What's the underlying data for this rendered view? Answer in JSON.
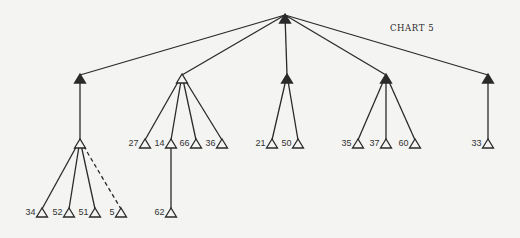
{
  "chart": {
    "title": "CHART 5",
    "stroke_color": "#2a2a2a",
    "background": "#f4f4f2"
  },
  "tree": {
    "root": {
      "id": "root",
      "x": 285,
      "y": 23,
      "filled": true
    },
    "nodes": [
      {
        "id": "a",
        "x": 80,
        "y": 83,
        "filled": true,
        "parent": "root"
      },
      {
        "id": "b",
        "x": 182,
        "y": 83,
        "filled": false,
        "parent": "root"
      },
      {
        "id": "c",
        "x": 287,
        "y": 83,
        "filled": true,
        "parent": "root"
      },
      {
        "id": "d",
        "x": 386,
        "y": 83,
        "filled": true,
        "parent": "root"
      },
      {
        "id": "e",
        "x": 488,
        "y": 83,
        "filled": true,
        "parent": "root"
      },
      {
        "id": "a1",
        "x": 80,
        "y": 148,
        "filled": false,
        "parent": "a"
      },
      {
        "id": "n34",
        "x": 42,
        "y": 217,
        "label": "34",
        "parent": "a1"
      },
      {
        "id": "n52",
        "x": 69,
        "y": 217,
        "label": "52",
        "parent": "a1"
      },
      {
        "id": "n51",
        "x": 95,
        "y": 217,
        "label": "51",
        "parent": "a1"
      },
      {
        "id": "n5",
        "x": 121,
        "y": 217,
        "label": "5",
        "parent": "a1",
        "dashed": true
      },
      {
        "id": "n27",
        "x": 145,
        "y": 148,
        "label": "27",
        "parent": "b"
      },
      {
        "id": "n14",
        "x": 171,
        "y": 148,
        "label": "14",
        "parent": "b"
      },
      {
        "id": "n66",
        "x": 196,
        "y": 148,
        "label": "66",
        "parent": "b"
      },
      {
        "id": "n36",
        "x": 222,
        "y": 148,
        "label": "36",
        "parent": "b"
      },
      {
        "id": "n62",
        "x": 171,
        "y": 217,
        "label": "62",
        "parent": "n14"
      },
      {
        "id": "n21",
        "x": 272,
        "y": 148,
        "label": "21",
        "parent": "c"
      },
      {
        "id": "n50",
        "x": 298,
        "y": 148,
        "label": "50",
        "parent": "c"
      },
      {
        "id": "n35",
        "x": 358,
        "y": 148,
        "label": "35",
        "parent": "d"
      },
      {
        "id": "n37",
        "x": 386,
        "y": 148,
        "label": "37",
        "parent": "d"
      },
      {
        "id": "n60",
        "x": 415,
        "y": 148,
        "label": "60",
        "parent": "d"
      },
      {
        "id": "n33",
        "x": 488,
        "y": 148,
        "label": "33",
        "parent": "e"
      }
    ]
  }
}
